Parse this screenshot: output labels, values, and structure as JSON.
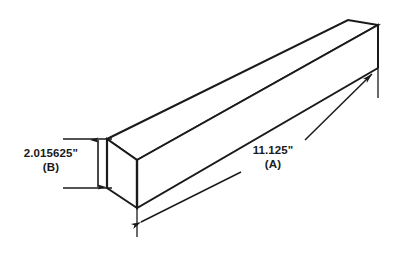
{
  "drawing": {
    "type": "isometric-rectangular-bar",
    "background_color": "#ffffff",
    "line_color": "#1a1a1a",
    "dimensions": {
      "height": {
        "value": "2.015625\"",
        "tag": "(B)",
        "orientation": "vertical",
        "arrow_style": "double-headed"
      },
      "length": {
        "value": "11.125\"",
        "tag": "(A)",
        "orientation": "diagonal",
        "arrow_style": "double-headed"
      }
    }
  }
}
